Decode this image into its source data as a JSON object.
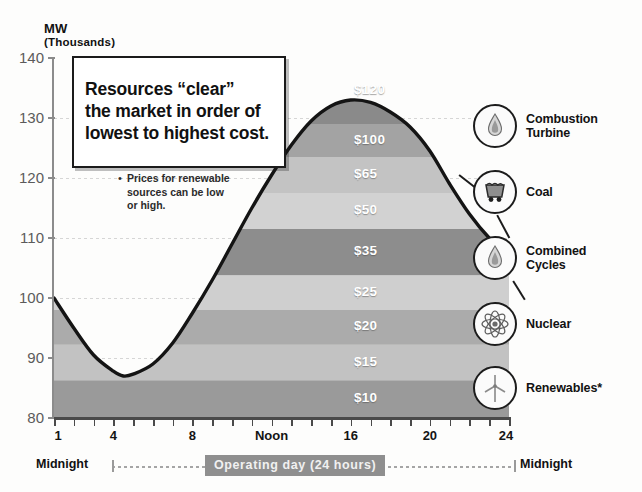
{
  "axis": {
    "y_title": "MW",
    "y_subtitle": "(Thousands)",
    "y_ticks": [
      "140",
      "130",
      "120",
      "110",
      "100",
      "90",
      "80"
    ],
    "x_ticks": [
      {
        "label": "1",
        "hour": 1
      },
      {
        "label": "4",
        "hour": 4
      },
      {
        "label": "8",
        "hour": 8
      },
      {
        "label": "Noon",
        "hour": 12
      },
      {
        "label": "16",
        "hour": 16
      },
      {
        "label": "20",
        "hour": 20
      },
      {
        "label": "24",
        "hour": 24
      }
    ]
  },
  "callout": {
    "text": "Resources “clear”\nthe market in order of\nlowest to highest cost."
  },
  "footnote": {
    "bullet": "•",
    "text": "Prices for renewable\nsources can be low\nor high."
  },
  "timeline": {
    "left_label": "Midnight",
    "right_label": "Midnight",
    "span_label": "Operating day (24 hours)"
  },
  "legend": {
    "items": [
      {
        "label": "Combustion\nTurbine",
        "icon": "flame-icon"
      },
      {
        "label": "Coal",
        "icon": "coal-cart-icon"
      },
      {
        "label": "Combined\nCycles",
        "icon": "flame-icon"
      },
      {
        "label": "Nuclear",
        "icon": "atom-icon"
      },
      {
        "label": "Renewables*",
        "icon": "wind-turbine-icon"
      }
    ]
  },
  "chart_data": {
    "type": "area",
    "title": "",
    "xlabel": "Operating day (24 hours)",
    "ylabel": "MW (Thousands)",
    "xlim": [
      1,
      24
    ],
    "ylim": [
      80,
      140
    ],
    "grid": true,
    "legend_position": "right",
    "x": [
      1,
      2,
      3,
      4,
      4.5,
      5,
      6,
      7,
      8,
      9,
      10,
      11,
      12,
      13,
      14,
      15,
      16,
      17,
      18,
      19,
      20,
      21,
      22,
      23,
      24
    ],
    "load_curve": [
      100,
      95,
      90.5,
      87.8,
      87,
      87.3,
      89,
      92.5,
      97.5,
      103,
      109,
      115,
      120.5,
      125.5,
      129.5,
      132,
      133,
      132.6,
      131,
      128.5,
      124.5,
      119,
      114,
      110,
      107
    ],
    "series": [
      {
        "name": "Renewables*",
        "price": "$10",
        "band": [
          80.0,
          86.3
        ],
        "color": "#9a9a9a"
      },
      {
        "name": "Renewables*",
        "price": "$15",
        "band": [
          86.3,
          92.2
        ],
        "color": "#c2c2c2"
      },
      {
        "name": "Nuclear",
        "price": "$20",
        "band": [
          92.2,
          98.0
        ],
        "color": "#ababab"
      },
      {
        "name": "Nuclear",
        "price": "$25",
        "band": [
          98.0,
          103.8
        ],
        "color": "#cfcfcf"
      },
      {
        "name": "Combined Cycles",
        "price": "$35",
        "band": [
          103.8,
          111.5
        ],
        "color": "#8d8d8d"
      },
      {
        "name": "Combined Cycles",
        "price": "$50",
        "band": [
          111.5,
          117.5
        ],
        "color": "#d2d2d2"
      },
      {
        "name": "Coal",
        "price": "$65",
        "band": [
          117.5,
          123.5
        ],
        "color": "#c3c3c3"
      },
      {
        "name": "Coal",
        "price": "$100",
        "band": [
          123.5,
          129.0
        ],
        "color": "#a3a3a3"
      },
      {
        "name": "Combustion Turbine",
        "price": "$120",
        "band": [
          129.0,
          140.0
        ],
        "color": "#8a8a8a"
      }
    ],
    "price_labels": [
      "$120",
      "$100",
      "$65",
      "$50",
      "$35",
      "$25",
      "$20",
      "$15",
      "$10"
    ]
  },
  "colors": {
    "axis": "#4a4a4a",
    "curve": "#141414",
    "grid": "#cfcfcf",
    "chip": "#8f8f8f",
    "price_text": "#ffffff"
  }
}
